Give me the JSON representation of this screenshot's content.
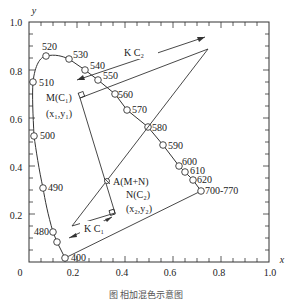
{
  "figure": {
    "type": "CIE 1931 chromaticity diagram — additive color mixing",
    "x_axis_label": "x",
    "y_axis_label": "y",
    "x_ticks": [
      "0",
      "0.2",
      "0.4",
      "0.6",
      "0.8",
      "1.0"
    ],
    "y_ticks": [
      "0.2",
      "0.4",
      "0.6",
      "0.8",
      "1.0"
    ],
    "caption": "图 相加混色示意图"
  },
  "spectral_locus": {
    "wavelength_labels": [
      {
        "label": "400",
        "x": 0.17,
        "y": 0.02
      },
      {
        "label": "480",
        "x": 0.1,
        "y": 0.12
      },
      {
        "label": "490",
        "x": 0.06,
        "y": 0.3
      },
      {
        "label": "500",
        "x": 0.02,
        "y": 0.53
      },
      {
        "label": "510",
        "x": 0.02,
        "y": 0.75
      },
      {
        "label": "520",
        "x": 0.07,
        "y": 0.86
      },
      {
        "label": "530",
        "x": 0.17,
        "y": 0.84
      },
      {
        "label": "540",
        "x": 0.23,
        "y": 0.8
      },
      {
        "label": "550",
        "x": 0.29,
        "y": 0.76
      },
      {
        "label": "560",
        "x": 0.36,
        "y": 0.7
      },
      {
        "label": "570",
        "x": 0.41,
        "y": 0.63
      },
      {
        "label": "580",
        "x": 0.5,
        "y": 0.56
      },
      {
        "label": "590",
        "x": 0.56,
        "y": 0.49
      },
      {
        "label": "600",
        "x": 0.63,
        "y": 0.4
      },
      {
        "label": "610",
        "x": 0.65,
        "y": 0.37
      },
      {
        "label": "620",
        "x": 0.68,
        "y": 0.34
      },
      {
        "label": "700-770",
        "x": 0.72,
        "y": 0.3
      }
    ]
  },
  "annotations": {
    "m_label": "M(C₁)",
    "m_coords": "(x₁,y₁)",
    "a_label": "A(M+N)",
    "n_label": "N(C₂)",
    "n_coords": "(x₂,y₂)",
    "kc1_label": "K C₁",
    "kc2_label": "K C₂"
  }
}
